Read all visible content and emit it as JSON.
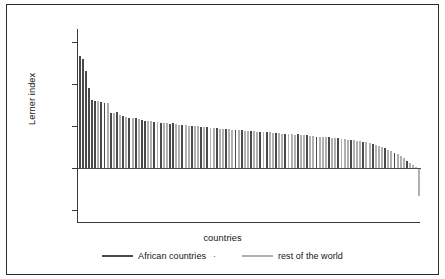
{
  "chart_data": {
    "type": "bar",
    "title": "",
    "xlabel": "countries",
    "ylabel": "Lerner index",
    "ylim": [
      -0.26,
      0.66
    ],
    "yticks": [
      0.6,
      0.4,
      0.2,
      0,
      -0.2
    ],
    "ytick_labels": [
      "0.6",
      "0.4",
      "0.2",
      "0",
      "−0.2"
    ],
    "grid": false,
    "legend_position": "bottom-center",
    "series": [
      {
        "name": "African countries",
        "color": "#4a4a4a"
      },
      {
        "name": "rest of the world",
        "color": "#b0b0b0"
      }
    ],
    "categories": [
      "c1",
      "c2",
      "c3",
      "c4",
      "c5",
      "c6",
      "c7",
      "c8",
      "c9",
      "c10",
      "c11",
      "c12",
      "c13",
      "c14",
      "c15",
      "c16",
      "c17",
      "c18",
      "c19",
      "c20",
      "c21",
      "c22",
      "c23",
      "c24",
      "c25",
      "c26",
      "c27",
      "c28",
      "c29",
      "c30",
      "c31",
      "c32",
      "c33",
      "c34",
      "c35",
      "c36",
      "c37",
      "c38",
      "c39",
      "c40",
      "c41",
      "c42",
      "c43",
      "c44",
      "c45",
      "c46",
      "c47",
      "c48",
      "c49",
      "c50",
      "c51",
      "c52",
      "c53",
      "c54",
      "c55",
      "c56",
      "c57",
      "c58",
      "c59",
      "c60",
      "c61",
      "c62",
      "c63",
      "c64",
      "c65",
      "c66",
      "c67",
      "c68",
      "c69",
      "c70",
      "c71",
      "c72",
      "c73",
      "c74",
      "c75",
      "c76",
      "c77",
      "c78",
      "c79",
      "c80",
      "c81",
      "c82",
      "c83",
      "c84",
      "c85",
      "c86",
      "c87",
      "c88",
      "c89",
      "c90",
      "c91",
      "c92",
      "c93",
      "c94",
      "c95",
      "c96",
      "c97",
      "c98",
      "c99",
      "c100",
      "c101",
      "c102",
      "c103",
      "c104",
      "c105",
      "c106",
      "c107",
      "c108",
      "c109",
      "c110"
    ],
    "values": [
      0.53,
      0.52,
      0.46,
      0.38,
      0.322,
      0.32,
      0.318,
      0.312,
      0.31,
      0.308,
      0.262,
      0.26,
      0.268,
      0.252,
      0.248,
      0.245,
      0.24,
      0.238,
      0.236,
      0.232,
      0.228,
      0.226,
      0.224,
      0.222,
      0.22,
      0.218,
      0.216,
      0.214,
      0.212,
      0.21,
      0.212,
      0.208,
      0.206,
      0.205,
      0.204,
      0.202,
      0.2,
      0.199,
      0.198,
      0.196,
      0.195,
      0.194,
      0.192,
      0.19,
      0.189,
      0.188,
      0.186,
      0.185,
      0.184,
      0.182,
      0.181,
      0.18,
      0.179,
      0.178,
      0.176,
      0.175,
      0.174,
      0.172,
      0.171,
      0.17,
      0.172,
      0.17,
      0.168,
      0.167,
      0.166,
      0.164,
      0.163,
      0.162,
      0.16,
      0.159,
      0.16,
      0.158,
      0.156,
      0.155,
      0.154,
      0.152,
      0.15,
      0.149,
      0.148,
      0.146,
      0.148,
      0.145,
      0.143,
      0.142,
      0.14,
      0.138,
      0.136,
      0.134,
      0.132,
      0.13,
      0.128,
      0.125,
      0.122,
      0.118,
      0.114,
      0.11,
      0.106,
      0.1,
      0.094,
      0.088,
      0.082,
      0.074,
      0.066,
      0.058,
      0.048,
      0.036,
      0.026,
      0.014,
      0.006,
      -0.13
    ],
    "group": [
      "african",
      "african",
      "african",
      "african",
      "african",
      "african",
      "rest",
      "african",
      "african",
      "rest",
      "african",
      "rest",
      "african",
      "rest",
      "african",
      "rest",
      "african",
      "rest",
      "african",
      "rest",
      "african",
      "african",
      "rest",
      "rest",
      "african",
      "rest",
      "african",
      "rest",
      "rest",
      "african",
      "african",
      "rest",
      "rest",
      "african",
      "rest",
      "rest",
      "african",
      "rest",
      "rest",
      "african",
      "rest",
      "african",
      "rest",
      "rest",
      "african",
      "rest",
      "rest",
      "african",
      "rest",
      "rest",
      "african",
      "rest",
      "african",
      "rest",
      "rest",
      "african",
      "rest",
      "rest",
      "african",
      "rest",
      "african",
      "rest",
      "rest",
      "african",
      "rest",
      "rest",
      "african",
      "rest",
      "rest",
      "rest",
      "african",
      "rest",
      "rest",
      "african",
      "rest",
      "rest",
      "african",
      "rest",
      "rest",
      "rest",
      "african",
      "rest",
      "rest",
      "african",
      "rest",
      "rest",
      "rest",
      "african",
      "rest",
      "rest",
      "rest",
      "african",
      "rest",
      "rest",
      "african",
      "rest",
      "rest",
      "rest",
      "african",
      "rest",
      "rest",
      "african",
      "rest",
      "rest",
      "rest",
      "african",
      "rest",
      "rest",
      "rest",
      "rest"
    ]
  },
  "legend": {
    "items": [
      {
        "label": "African countries",
        "color": "#4a4a4a"
      },
      {
        "label": "rest of the world",
        "color": "#b0b0b0"
      }
    ],
    "separator": "·"
  },
  "axes": {
    "y_title": "Lerner index",
    "x_title": "countries"
  },
  "colors": {
    "african": "#4a4a4a",
    "rest": "#b0b0b0",
    "axis": "#3a3a3a",
    "frame": "#2b2b2b"
  }
}
